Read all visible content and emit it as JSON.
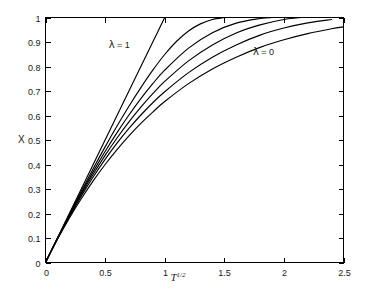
{
  "chart_data": {
    "type": "line",
    "title": "",
    "xlabel": "T^1/2",
    "xlabel_base": "T",
    "xlabel_exponent": "1/2",
    "ylabel": "X",
    "xlim": [
      0,
      2.5
    ],
    "ylim": [
      0,
      1
    ],
    "grid": false,
    "legend": "none",
    "background_color": "#ffffff",
    "curve_color": "#000000",
    "axis_color": "#000000",
    "xticks": [
      0,
      0.5,
      1,
      1.5,
      2,
      2.5
    ],
    "xtick_labels": [
      "0",
      "0.5",
      "1",
      "1.5",
      "2",
      "2.5"
    ],
    "yticks": [
      0,
      0.1,
      0.2,
      0.3,
      0.4,
      0.5,
      0.6,
      0.7,
      0.8,
      0.9,
      1
    ],
    "ytick_labels": [
      "0",
      "0.1",
      "0.2",
      "0.3",
      "0.4",
      "0.5",
      "0.6",
      "0.7",
      "0.8",
      "0.9",
      "1"
    ],
    "annotations": [
      {
        "text": "λ = 1",
        "symbol": "λ",
        "body": " = 1",
        "x": 0.53,
        "y": 0.875
      },
      {
        "text": "λ = 0",
        "symbol": "λ",
        "body": " = 0",
        "x": 1.74,
        "y": 0.845
      }
    ],
    "series": [
      {
        "name": "lambda = 1",
        "lambda": 1,
        "x": [
          0,
          0.1,
          0.2,
          0.3,
          0.4,
          0.5,
          0.6,
          0.7,
          0.8,
          0.9,
          1.0
        ],
        "y": [
          0,
          0.1,
          0.2,
          0.3,
          0.4,
          0.5,
          0.6,
          0.7,
          0.8,
          0.9,
          1.0
        ]
      },
      {
        "name": "lambda = 0.8",
        "lambda": 0.8,
        "x": [
          0,
          0.1,
          0.2,
          0.3,
          0.4,
          0.5,
          0.6,
          0.7,
          0.8,
          0.9,
          1.0,
          1.1,
          1.2,
          1.3,
          1.4,
          1.5
        ],
        "y": [
          0,
          0.099,
          0.196,
          0.291,
          0.383,
          0.472,
          0.557,
          0.638,
          0.714,
          0.785,
          0.849,
          0.903,
          0.945,
          0.974,
          0.992,
          1.0
        ]
      },
      {
        "name": "lambda = 0.6",
        "lambda": 0.6,
        "x": [
          0,
          0.1,
          0.2,
          0.3,
          0.4,
          0.5,
          0.6,
          0.7,
          0.8,
          0.9,
          1.0,
          1.2,
          1.4,
          1.6,
          1.8,
          1.9
        ],
        "y": [
          0,
          0.098,
          0.193,
          0.284,
          0.371,
          0.453,
          0.53,
          0.602,
          0.669,
          0.73,
          0.785,
          0.875,
          0.938,
          0.977,
          0.996,
          1.0
        ]
      },
      {
        "name": "lambda = 0.4",
        "lambda": 0.4,
        "x": [
          0,
          0.1,
          0.2,
          0.3,
          0.4,
          0.5,
          0.6,
          0.7,
          0.8,
          0.9,
          1.0,
          1.2,
          1.4,
          1.6,
          1.8,
          2.0,
          2.15
        ],
        "y": [
          0,
          0.097,
          0.19,
          0.278,
          0.36,
          0.437,
          0.508,
          0.574,
          0.634,
          0.689,
          0.739,
          0.823,
          0.888,
          0.937,
          0.97,
          0.992,
          1.0
        ]
      },
      {
        "name": "lambda = 0.2",
        "lambda": 0.2,
        "x": [
          0,
          0.1,
          0.2,
          0.3,
          0.4,
          0.5,
          0.6,
          0.7,
          0.8,
          0.9,
          1.0,
          1.2,
          1.4,
          1.6,
          1.8,
          2.0,
          2.2,
          2.4
        ],
        "y": [
          0,
          0.096,
          0.186,
          0.271,
          0.349,
          0.421,
          0.487,
          0.547,
          0.602,
          0.652,
          0.697,
          0.775,
          0.838,
          0.888,
          0.928,
          0.957,
          0.978,
          0.992
        ]
      },
      {
        "name": "lambda = 0",
        "lambda": 0,
        "x": [
          0,
          0.1,
          0.2,
          0.3,
          0.4,
          0.5,
          0.6,
          0.7,
          0.8,
          0.9,
          1.0,
          1.2,
          1.4,
          1.6,
          1.8,
          2.0,
          2.2,
          2.4,
          2.5
        ],
        "y": [
          0,
          0.095,
          0.181,
          0.26,
          0.333,
          0.4,
          0.461,
          0.517,
          0.568,
          0.614,
          0.657,
          0.73,
          0.79,
          0.838,
          0.878,
          0.909,
          0.934,
          0.954,
          0.962
        ]
      }
    ]
  }
}
